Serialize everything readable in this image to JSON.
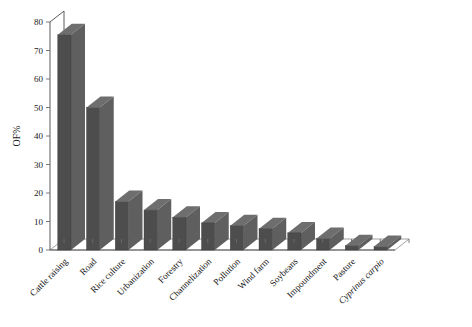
{
  "chart_data": {
    "type": "bar",
    "title": "",
    "subtitle": "",
    "xlabel": "",
    "ylabel": "OF%",
    "ylim": [
      0,
      80
    ],
    "yticks": [
      0,
      10,
      20,
      30,
      40,
      50,
      60,
      70,
      80
    ],
    "ytick_labels": [
      "0",
      "10",
      "20",
      "30",
      "40",
      "50",
      "60",
      "70",
      "80"
    ],
    "grid": false,
    "legend": false,
    "legend_position": "none",
    "style_3d": true,
    "bar_color": "#4d4d4d",
    "categories": [
      "Cattle raising",
      "Road",
      "Rice culture",
      "Urbanization",
      "Forestry",
      "Channelization",
      "Pollution",
      "Wind farm",
      "Soybeans",
      "Impoundment",
      "Pasture",
      "Cyprinus carpio"
    ],
    "category_styles": [
      "normal",
      "normal",
      "normal",
      "normal",
      "normal",
      "normal",
      "normal",
      "normal",
      "normal",
      "normal",
      "normal",
      "italic"
    ],
    "values": [
      75.5,
      50,
      17,
      14,
      11.5,
      9.5,
      8.5,
      7.5,
      6,
      4,
      1.5,
      1.2
    ],
    "series": [
      {
        "name": "OF%",
        "values": [
          75.5,
          50,
          17,
          14,
          11.5,
          9.5,
          8.5,
          7.5,
          6,
          4,
          1.5,
          1.2
        ]
      }
    ]
  }
}
